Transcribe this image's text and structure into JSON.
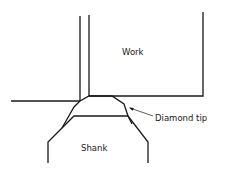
{
  "diagram": {
    "type": "technical-drawing",
    "labels": {
      "work": "Work",
      "diamond_tip": "Diamond tip",
      "shank": "Shank"
    },
    "colors": {
      "stroke": "#1a1a1a",
      "background": "#ffffff"
    }
  }
}
